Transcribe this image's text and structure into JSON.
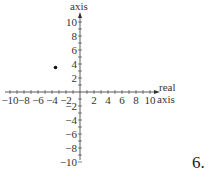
{
  "chart_data": {
    "type": "scatter",
    "title": "",
    "xlabel": "real axis",
    "ylabel": "axis",
    "xlim": [
      -10,
      10
    ],
    "ylim": [
      -10,
      10
    ],
    "x_ticks": [
      -10,
      -8,
      -6,
      -4,
      -2,
      2,
      4,
      6,
      8,
      10
    ],
    "y_ticks": [
      -10,
      -8,
      -6,
      -4,
      -2,
      2,
      4,
      6,
      8,
      10
    ],
    "minor_tick_step": 1,
    "grid": false,
    "points": [
      {
        "x": -3.5,
        "y": 3.5
      }
    ]
  },
  "labels": {
    "y_axis": "axis",
    "x_axis_line1": "real",
    "x_axis_line2": "axis",
    "problem_number": "6."
  },
  "colors": {
    "axis": "#333333",
    "point": "#111111"
  }
}
